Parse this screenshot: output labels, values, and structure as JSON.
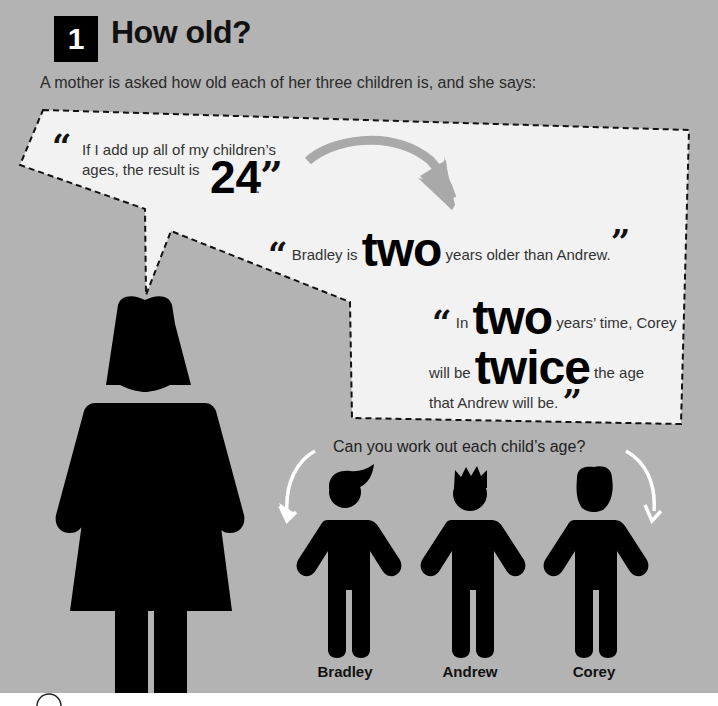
{
  "header": {
    "number": "1",
    "title": "How old?"
  },
  "intro": "A mother is asked how old each of her three children is, and she says:",
  "speech_bubble": {
    "quote1": {
      "open_mark": "“",
      "line1": "If I add up all of my children’s",
      "line2": "ages, the result is",
      "big": "24",
      "close_mark": "”",
      "end": "."
    },
    "quote2": {
      "open_mark": "“",
      "pre": "Bradley is",
      "big": "two",
      "post": "years older than Andrew.",
      "close_mark": "”"
    },
    "quote3": {
      "open_mark": "“",
      "pre": "In",
      "big1": "two",
      "post1": "years’ time, Corey",
      "pre2": "will be",
      "big2": "twice",
      "post2": "the age",
      "line3": "that Andrew will be.",
      "close_mark": "”"
    }
  },
  "question": "Can you work out each child’s age?",
  "children": [
    {
      "name": "Bradley"
    },
    {
      "name": "Andrew"
    },
    {
      "name": "Corey"
    }
  ],
  "colors": {
    "background": "#b3b3b3",
    "bubble": "#f2f2f2",
    "figure": "#000000",
    "arrow_grey": "#a9a9a9",
    "arrow_white": "#ffffff"
  }
}
